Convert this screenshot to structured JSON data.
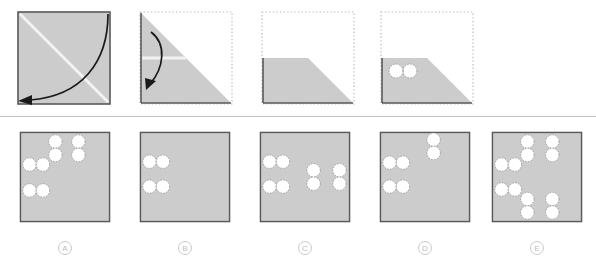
{
  "figure": {
    "type": "paper-folding-puzzle",
    "background_color": "#ffffff",
    "paper_fill": "#cccccc",
    "paper_edge_color": "#595959",
    "ghost_outline_color": "#bdbdbd",
    "crease_color": "#f2f2f2",
    "hole_fill": "#ffffff",
    "hole_edge_color": "#9a9a9a",
    "arrow_color": "#1a1a1a",
    "divider_color": "#bfbfbf"
  },
  "sequence": {
    "title": "",
    "steps": [
      {
        "index": 1,
        "name": "unfolded-square",
        "description": "Full square sheet with diagonal crease from top-left to bottom-right; arrow folds top-right corner down to bottom-left corner.",
        "shape": "square",
        "crease": "diagonal-tl-br",
        "arrow": "corner-fold-tr-to-bl",
        "holes": []
      },
      {
        "index": 2,
        "name": "folded-triangle",
        "description": "Triangle occupying the upper-left half of the original square, with a horizontal crease at mid-height; arrow folds the top portion downward.",
        "shape": "triangle-upper-left",
        "crease": "horizontal-mid",
        "arrow": "horizontal-fold-down",
        "holes": []
      },
      {
        "index": 3,
        "name": "folded-trapezoid",
        "description": "Trapezoid occupying the lower half after the second fold; no holes punched yet.",
        "shape": "trapezoid-lower",
        "crease": "none",
        "arrow": "none",
        "holes": []
      },
      {
        "index": 4,
        "name": "punched-trapezoid",
        "description": "Same trapezoid with two holes punched side by side near the upper-left.",
        "shape": "trapezoid-lower",
        "crease": "none",
        "arrow": "none",
        "holes": [
          {
            "cx": 14,
            "cy": 26,
            "r": 7
          },
          {
            "cx": 28,
            "cy": 26,
            "r": 7
          }
        ]
      }
    ]
  },
  "options": {
    "count": 5,
    "items": [
      {
        "label": "A",
        "name": "option-a",
        "hole_count": 8,
        "holes": [
          {
            "cx": 38,
            "cy": 11,
            "r": 7
          },
          {
            "cx": 38,
            "cy": 25,
            "r": 7
          },
          {
            "cx": 62,
            "cy": 11,
            "r": 7
          },
          {
            "cx": 62,
            "cy": 25,
            "r": 7
          },
          {
            "cx": 11,
            "cy": 35,
            "r": 7
          },
          {
            "cx": 25,
            "cy": 35,
            "r": 7
          },
          {
            "cx": 11,
            "cy": 62,
            "r": 7
          },
          {
            "cx": 25,
            "cy": 62,
            "r": 7
          }
        ]
      },
      {
        "label": "B",
        "name": "option-b",
        "hole_count": 4,
        "holes": [
          {
            "cx": 11,
            "cy": 32,
            "r": 7
          },
          {
            "cx": 25,
            "cy": 32,
            "r": 7
          },
          {
            "cx": 11,
            "cy": 58,
            "r": 7
          },
          {
            "cx": 25,
            "cy": 58,
            "r": 7
          }
        ]
      },
      {
        "label": "C",
        "name": "option-c",
        "hole_count": 8,
        "holes": [
          {
            "cx": 11,
            "cy": 32,
            "r": 7
          },
          {
            "cx": 25,
            "cy": 32,
            "r": 7
          },
          {
            "cx": 11,
            "cy": 58,
            "r": 7
          },
          {
            "cx": 25,
            "cy": 58,
            "r": 7
          },
          {
            "cx": 57,
            "cy": 41,
            "r": 7
          },
          {
            "cx": 57,
            "cy": 55,
            "r": 7
          },
          {
            "cx": 84,
            "cy": 41,
            "r": 7
          },
          {
            "cx": 84,
            "cy": 55,
            "r": 7
          }
        ]
      },
      {
        "label": "D",
        "name": "option-d",
        "hole_count": 6,
        "holes": [
          {
            "cx": 57,
            "cy": 9,
            "r": 7
          },
          {
            "cx": 57,
            "cy": 23,
            "r": 7
          },
          {
            "cx": 11,
            "cy": 33,
            "r": 7
          },
          {
            "cx": 25,
            "cy": 33,
            "r": 7
          },
          {
            "cx": 11,
            "cy": 58,
            "r": 7
          },
          {
            "cx": 25,
            "cy": 58,
            "r": 7
          }
        ]
      },
      {
        "label": "E",
        "name": "option-e",
        "hole_count": 12,
        "holes": [
          {
            "cx": 38,
            "cy": 11,
            "r": 7
          },
          {
            "cx": 38,
            "cy": 25,
            "r": 7
          },
          {
            "cx": 64,
            "cy": 11,
            "r": 7
          },
          {
            "cx": 64,
            "cy": 25,
            "r": 7
          },
          {
            "cx": 11,
            "cy": 35,
            "r": 7
          },
          {
            "cx": 25,
            "cy": 35,
            "r": 7
          },
          {
            "cx": 11,
            "cy": 61,
            "r": 7
          },
          {
            "cx": 25,
            "cy": 61,
            "r": 7
          },
          {
            "cx": 38,
            "cy": 71,
            "r": 7
          },
          {
            "cx": 38,
            "cy": 85,
            "r": 7
          },
          {
            "cx": 64,
            "cy": 71,
            "r": 7
          },
          {
            "cx": 64,
            "cy": 85,
            "r": 7
          }
        ]
      }
    ]
  }
}
